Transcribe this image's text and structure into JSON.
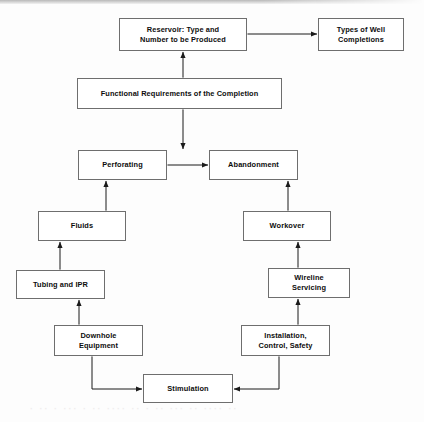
{
  "diagram": {
    "type": "flowchart",
    "background_color": "#fdfdfd",
    "box_border_color": "#6e6e6e",
    "box_fill_color": "#ffffff",
    "connector_color": "#1a1a1a",
    "nodes": [
      {
        "id": "reservoir",
        "label": "Reservoir:  Type and\nNumber to be Produced",
        "x": 119,
        "y": 18,
        "w": 128,
        "h": 33
      },
      {
        "id": "well-completions",
        "label": "Types of Well\nCompletions",
        "x": 318,
        "y": 18,
        "w": 86,
        "h": 33
      },
      {
        "id": "functional-requirements",
        "label": "Functional Requirements of the Completion",
        "x": 77,
        "y": 78,
        "w": 205,
        "h": 31
      },
      {
        "id": "perforating",
        "label": "Perforating",
        "x": 78,
        "y": 150,
        "w": 89,
        "h": 30
      },
      {
        "id": "abandonment",
        "label": "Abandonment",
        "x": 209,
        "y": 150,
        "w": 89,
        "h": 30
      },
      {
        "id": "fluids",
        "label": "Fluids",
        "x": 38,
        "y": 211,
        "w": 88,
        "h": 30
      },
      {
        "id": "workover",
        "label": "Workover",
        "x": 243,
        "y": 211,
        "w": 88,
        "h": 30
      },
      {
        "id": "tubing-and-ipr",
        "label": "Tubing and IPR",
        "x": 16,
        "y": 270,
        "w": 89,
        "h": 29
      },
      {
        "id": "wireline-servicing",
        "label": "Wireline\nServicing",
        "x": 268,
        "y": 268,
        "w": 82,
        "h": 30
      },
      {
        "id": "downhole-equipment",
        "label": "Downhole\nEquipment",
        "x": 54,
        "y": 325,
        "w": 89,
        "h": 31
      },
      {
        "id": "installation-control-safety",
        "label": "Installation,\nControl, Safety",
        "x": 241,
        "y": 325,
        "w": 89,
        "h": 31
      },
      {
        "id": "stimulation",
        "label": "Stimulation",
        "x": 143,
        "y": 374,
        "w": 90,
        "h": 29
      }
    ],
    "edges": [
      {
        "id": "reservoir-well-completions",
        "from": "reservoir",
        "to": "well-completions",
        "direction": "both",
        "orientation": "horizontal"
      },
      {
        "id": "functional-requirements-reservoir",
        "from": "functional-requirements",
        "to": "reservoir",
        "direction": "both",
        "orientation": "vertical"
      },
      {
        "id": "functional-requirements-abandonment",
        "from": "functional-requirements",
        "to": "abandonment",
        "direction": "both",
        "orientation": "vertical"
      },
      {
        "id": "perforating-abandonment",
        "from": "perforating",
        "to": "abandonment",
        "direction": "both",
        "orientation": "horizontal"
      },
      {
        "id": "fluids-perforating",
        "from": "fluids",
        "to": "perforating",
        "direction": "both",
        "orientation": "vertical"
      },
      {
        "id": "workover-abandonment",
        "from": "workover",
        "to": "abandonment",
        "direction": "both",
        "orientation": "vertical"
      },
      {
        "id": "tubing-and-ipr-fluids",
        "from": "tubing-and-ipr",
        "to": "fluids",
        "direction": "both",
        "orientation": "vertical"
      },
      {
        "id": "wireline-servicing-workover",
        "from": "wireline-servicing",
        "to": "workover",
        "direction": "both",
        "orientation": "vertical"
      },
      {
        "id": "downhole-equipment-tubing-and-ipr",
        "from": "downhole-equipment",
        "to": "tubing-and-ipr",
        "direction": "both",
        "orientation": "vertical"
      },
      {
        "id": "installation-control-safety-wireline-servicing",
        "from": "installation-control-safety",
        "to": "wireline-servicing",
        "direction": "both",
        "orientation": "vertical"
      },
      {
        "id": "stimulation-downhole-equipment",
        "from": "stimulation",
        "to": "downhole-equipment",
        "direction": "both",
        "orientation": "elbow-left"
      },
      {
        "id": "stimulation-installation-control-safety",
        "from": "stimulation",
        "to": "installation-control-safety",
        "direction": "both",
        "orientation": "elbow-right"
      }
    ]
  },
  "artifacts": {
    "ghost_text": "· ·· ·  ··· · ·· ···· ·· ·  ·· ··· ·· ···· ··"
  }
}
